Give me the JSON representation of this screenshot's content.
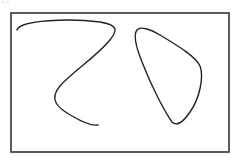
{
  "figure": {
    "corner_mark": "·□",
    "frame": {
      "x": 11,
      "y": 13,
      "width": 218,
      "height": 139,
      "stroke": "#333333",
      "stroke_width": 1.6
    },
    "strokes": [
      {
        "name": "open-curve-z-shape",
        "closed": false,
        "stroke": "#222222",
        "stroke_width": 1.4
      },
      {
        "name": "closed-loop-teardrop",
        "closed": true,
        "stroke": "#222222",
        "stroke_width": 1.4
      }
    ]
  }
}
